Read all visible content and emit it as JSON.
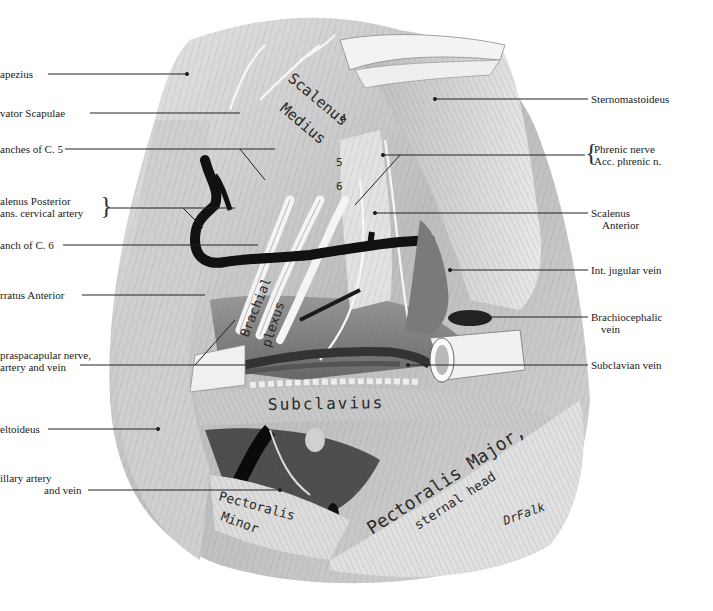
{
  "figure": {
    "colors": {
      "background": "#ffffff",
      "muscle_light": "#d9d9d9",
      "muscle_mid": "#a8a8a8",
      "muscle_dark": "#5a5a5a",
      "vessel": "#111111",
      "nerve": "#f2f2f2",
      "leader_line": "#222222"
    }
  },
  "left_labels": [
    {
      "id": "trapezius",
      "text": "apezius",
      "y": 74,
      "line_end_x": 187
    },
    {
      "id": "levator-scapulae",
      "text": "vator Scapulae",
      "y": 113,
      "line_end_x": 240
    },
    {
      "id": "branches-c5",
      "text": "anches of C. 5",
      "y": 149,
      "line_end_x": 275
    },
    {
      "id": "scalenus-posterior",
      "text": "alenus Posterior",
      "text2": "ans. cervical artery",
      "y": 208,
      "line_end_x": 235,
      "bracket": true
    },
    {
      "id": "branch-c6",
      "text": "anch of C. 6",
      "y": 245,
      "line_end_x": 258
    },
    {
      "id": "serratus-anterior",
      "text": "rratus Anterior",
      "y": 295,
      "line_end_x": 205
    },
    {
      "id": "suprascapular",
      "text": "praspacapular nerve,",
      "text2": "artery and vein",
      "y": 365,
      "line_end_x": 245
    },
    {
      "id": "deltoideus",
      "text": "eltoideus",
      "y": 429,
      "line_end_x": 158
    },
    {
      "id": "axillary",
      "text": "illary artery",
      "text2": "and vein",
      "y": 490,
      "line_end_x": 280
    }
  ],
  "right_labels": [
    {
      "id": "sternomastoideus",
      "text": "Sternomastoideus",
      "y": 99,
      "line_start_x": 435
    },
    {
      "id": "phrenic",
      "text": "Phrenic nerve",
      "text2": "Acc. phrenic n.",
      "y": 155,
      "line_start_x": 383,
      "bracket": true
    },
    {
      "id": "scalenus-anterior",
      "text": "Scalenus",
      "text2": "Anterior",
      "y": 213,
      "line_start_x": 375
    },
    {
      "id": "int-jugular",
      "text": "Int. jugular vein",
      "y": 270,
      "line_start_x": 450
    },
    {
      "id": "brachiocephalic",
      "text": "Brachiocephalic",
      "text2": "vein",
      "y": 317,
      "line_start_x": 480
    },
    {
      "id": "subclavian-vein",
      "text": "Subclavian vein",
      "y": 365,
      "line_start_x": 408
    }
  ],
  "inline_labels": {
    "scalenus_medius_1": "Scalenus",
    "scalenus_medius_2": "Medius",
    "brachial_1": "Brachial",
    "brachial_2": "plexus",
    "subclavius": "Subclavius",
    "pectoralis_major_1": "Pectoralis Major,",
    "pectoralis_major_2": "sternal head",
    "pectoralis_minor_1": "Pectoralis",
    "pectoralis_minor_2": "Minor",
    "nerve_root_numbers": [
      "4",
      "5",
      "6",
      "5",
      "6"
    ],
    "signature": "DrFalk"
  }
}
